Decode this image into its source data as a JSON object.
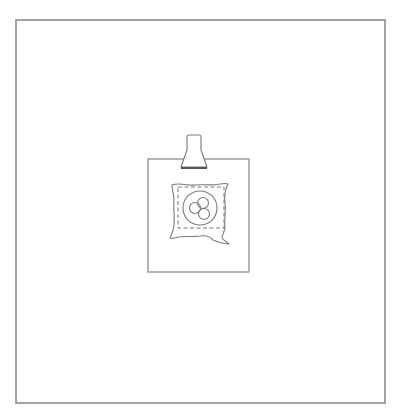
{
  "figure": {
    "type": "patent-style line drawing",
    "colors": {
      "background": "#ffffff",
      "frame_stroke": "#8c8c8c",
      "line_stroke": "#7a7a7a",
      "clip_base_stroke": "#555555"
    },
    "frame": {
      "x": 16,
      "y": 20,
      "width": 369,
      "height": 383
    },
    "card": {
      "x": 148,
      "y": 159,
      "width": 101,
      "height": 113
    },
    "clip": {
      "neck_top_y": 135,
      "neck_left_x": 187,
      "neck_right_x": 201,
      "flare_start_y": 150,
      "base_y": 168,
      "base_left_x": 181,
      "base_right_x": 207
    },
    "sachet": {
      "dashed_seam": {
        "x": 178,
        "y": 187,
        "width": 46,
        "height": 41
      },
      "emblem_circle": {
        "cx": 200,
        "cy": 208,
        "r": 17
      },
      "inner_circles": [
        {
          "cx": 195,
          "cy": 208,
          "r": 5.5
        },
        {
          "cx": 203,
          "cy": 203,
          "r": 5.5
        },
        {
          "cx": 204,
          "cy": 214,
          "r": 5.5
        }
      ]
    }
  }
}
